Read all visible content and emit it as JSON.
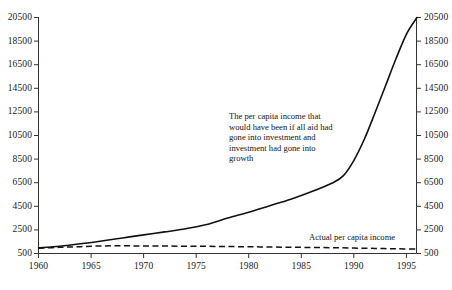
{
  "chart_data": {
    "type": "line",
    "title": "",
    "subtitle": "",
    "xlabel": "",
    "ylabel": "",
    "grid": false,
    "legend_position": "inline-annotation",
    "xlim": [
      1960,
      1996
    ],
    "ylim": [
      500,
      20500
    ],
    "x_ticks": [
      "1960",
      "1965",
      "1970",
      "1975",
      "1980",
      "1985",
      "1990",
      "1995"
    ],
    "x_tick_values": [
      1960,
      1965,
      1970,
      1975,
      1980,
      1985,
      1990,
      1995
    ],
    "y_ticks": [
      "500",
      "2500",
      "4500",
      "6500",
      "8500",
      "10500",
      "12500",
      "14500",
      "16500",
      "18500",
      "20500"
    ],
    "y_tick_values": [
      500,
      2500,
      4500,
      6500,
      8500,
      10500,
      12500,
      14500,
      16500,
      18500,
      20500
    ],
    "y_axis_right_ticks": [
      "500",
      "2500",
      "4500",
      "6500",
      "8500",
      "10500",
      "12500",
      "14500",
      "16500",
      "18500",
      "20500"
    ],
    "series": [
      {
        "name": "The per capita income that would have been if all aid had gone into investment and investment had gone into growth",
        "style": "solid",
        "color": "#111111",
        "x": [
          1960,
          1962,
          1964,
          1966,
          1968,
          1970,
          1972,
          1974,
          1976,
          1978,
          1980,
          1982,
          1984,
          1986,
          1988,
          1989,
          1990,
          1991,
          1992,
          1993,
          1994,
          1995,
          1996
        ],
        "values": [
          980,
          1120,
          1320,
          1560,
          1820,
          2080,
          2330,
          2600,
          2950,
          3500,
          4000,
          4550,
          5100,
          5750,
          6500,
          7100,
          8400,
          10200,
          12400,
          14700,
          17000,
          19100,
          20500
        ]
      },
      {
        "name": "Actual per capita income",
        "style": "dashed",
        "color": "#111111",
        "x": [
          1960,
          1962,
          1964,
          1966,
          1968,
          1970,
          1972,
          1974,
          1976,
          1978,
          1980,
          1982,
          1984,
          1986,
          1988,
          1990,
          1992,
          1994,
          1996
        ],
        "values": [
          950,
          1020,
          1080,
          1140,
          1150,
          1140,
          1130,
          1120,
          1110,
          1090,
          1070,
          1050,
          1030,
          1010,
          990,
          960,
          930,
          900,
          880
        ]
      }
    ],
    "annotations": [
      {
        "id": "series-annotation",
        "text": "The per capita income that\nwould have been if all aid had\ngone into investment and\ninvestment had gone into\ngrowth"
      },
      {
        "id": "actual-label",
        "text": "Actual per capita income"
      }
    ]
  },
  "axes": {
    "left_ticks": [
      "20500",
      "18500",
      "16500",
      "14500",
      "12500",
      "10500",
      "8500",
      "6500",
      "4500",
      "2500",
      "500"
    ],
    "right_ticks": [
      "20500",
      "18500",
      "16500",
      "14500",
      "12500",
      "10500",
      "8500",
      "6500",
      "4500",
      "2500",
      "500"
    ],
    "bottom_ticks": [
      "1960",
      "1965",
      "1970",
      "1975",
      "1980",
      "1985",
      "1990",
      "1995"
    ]
  },
  "colors": {
    "axis": "#333333",
    "series_solid": "#111111",
    "series_dashed": "#111111",
    "background": "#ffffff",
    "text": "#1a1a1a"
  }
}
